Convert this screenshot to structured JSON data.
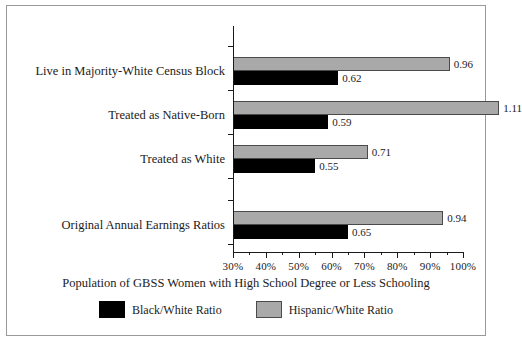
{
  "chart_data": {
    "type": "bar",
    "orientation": "horizontal",
    "title": "",
    "xlabel": "Population of GBSS Women with High School Degree or Less Schooling",
    "ylabel": "",
    "categories": [
      "Live in Majority-White Census Block",
      "Treated as Native-Born",
      "Treated as White",
      "Original Annual Earnings Ratios"
    ],
    "series": [
      {
        "name": "Black/White Ratio",
        "color": "#000000",
        "values": [
          0.62,
          0.59,
          0.55,
          0.65
        ],
        "labels": [
          "0.62",
          "0.59",
          "0.55",
          "0.65"
        ]
      },
      {
        "name": "Hispanic/White Ratio",
        "color": "#a9a9a9",
        "values": [
          0.96,
          1.11,
          0.71,
          0.94
        ],
        "labels": [
          "0.96",
          "1.11",
          "0.71",
          "0.94"
        ]
      }
    ],
    "xlim": [
      0.3,
      1.0
    ],
    "xtick_labels": [
      "30%",
      "40%",
      "50%",
      "60%",
      "70%",
      "80%",
      "90%",
      "100%"
    ],
    "xtick_values": [
      0.3,
      0.4,
      0.5,
      0.6,
      0.7,
      0.8,
      0.9,
      1.0
    ],
    "minor_tick_values": [
      0.35,
      0.45,
      0.55,
      0.65,
      0.75,
      0.85,
      0.95
    ],
    "grid": false,
    "legend_position": "bottom",
    "legend": [
      "Black/White Ratio",
      "Hispanic/White Ratio"
    ]
  },
  "axis": {
    "x_title": "Population of GBSS Women with High School Degree or Less Schooling"
  },
  "legend": {
    "entries": [
      {
        "label": "Black/White Ratio"
      },
      {
        "label": "Hispanic/White Ratio"
      }
    ]
  }
}
